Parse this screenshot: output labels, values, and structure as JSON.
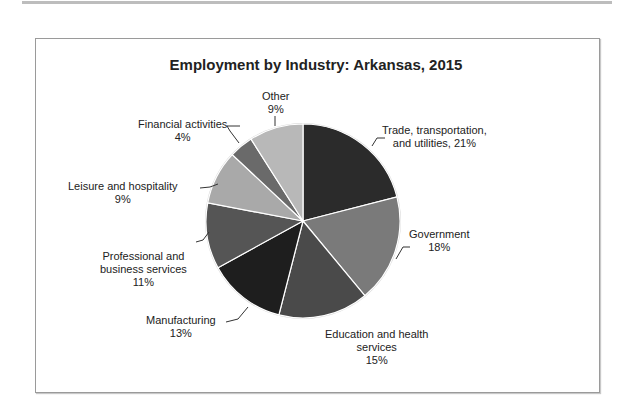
{
  "chart_data": {
    "type": "pie",
    "title": "Employment by Industry: Arkansas, 2015",
    "start_angle": "12 o'clock, clockwise",
    "categories": [
      "Trade, transportation, and utilities",
      "Government",
      "Education and health services",
      "Manufacturing",
      "Professional and business services",
      "Leisure and hospitality",
      "Financial activities",
      "Other"
    ],
    "values": [
      21,
      18,
      15,
      13,
      11,
      9,
      4,
      9
    ],
    "unit": "%",
    "colors": [
      "#2b2b2b",
      "#7a7a7a",
      "#4a4a4a",
      "#1e1e1e",
      "#555555",
      "#a9a9a9",
      "#6a6a6a",
      "#b8b8b8"
    ],
    "legend": "none (data labels with leader lines)"
  },
  "labels": {
    "trade_line1": "Trade, transportation,",
    "trade_line2": "and utilities, 21%",
    "government_line1": "Government",
    "government_line2": "18%",
    "education_line1": "Education and health",
    "education_line2": "services",
    "education_line3": "15%",
    "manufacturing_line1": "Manufacturing",
    "manufacturing_line2": "13%",
    "professional_line1": "Professional and",
    "professional_line2": "business services",
    "professional_line3": "11%",
    "leisure_line1": "Leisure and hospitality",
    "leisure_line2": "9%",
    "financial_line1": "Financial activities",
    "financial_line2": "4%",
    "other_line1": "Other",
    "other_line2": "9%"
  }
}
